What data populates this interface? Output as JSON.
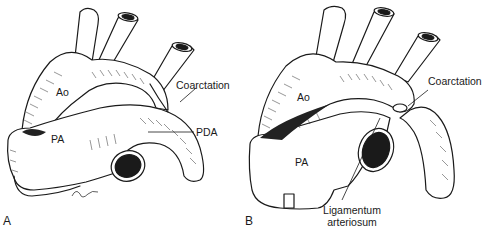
{
  "figure": {
    "panels": [
      {
        "id": "A",
        "panel_label": "A",
        "labels": {
          "aorta": "Ao",
          "pulmonary_artery": "PA",
          "coarctation": "Coarctation",
          "pda": "PDA"
        }
      },
      {
        "id": "B",
        "panel_label": "B",
        "labels": {
          "aorta": "Ao",
          "pulmonary_artery": "PA",
          "coarctation": "Coarctation",
          "ligamentum_line1": "Ligamentum",
          "ligamentum_line2": "arteriosum"
        }
      }
    ],
    "colors": {
      "ink": "#1a1a1a",
      "background": "#ffffff",
      "shade": "#222222"
    }
  }
}
